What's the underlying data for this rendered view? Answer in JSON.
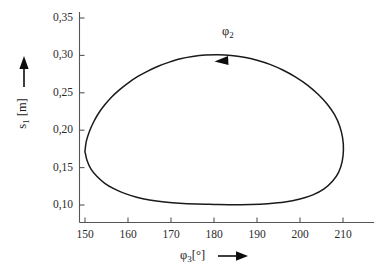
{
  "chart_data": {
    "type": "line",
    "title": "",
    "subtitle": "",
    "xlabel": "φ₃[°]",
    "ylabel": "s₁ [m]",
    "xlim": [
      144,
      216
    ],
    "ylim": [
      0.082,
      0.352
    ],
    "grid": false,
    "legend": null,
    "legend_position": "none",
    "xticks": [
      150,
      160,
      170,
      180,
      190,
      200,
      210
    ],
    "xtick_labels": [
      "150",
      "160",
      "170",
      "180",
      "190",
      "200",
      "210"
    ],
    "yticks": [
      0.1,
      0.15,
      0.2,
      0.25,
      0.3,
      0.35
    ],
    "ytick_labels": [
      "0,10",
      "0,15",
      "0,20",
      "0,25",
      "0,30",
      "0,35"
    ],
    "series": [
      {
        "name": "closed-orbit",
        "closed": true,
        "color": "#1a1a1a",
        "linewidth": 1.5,
        "points": [
          [
            150.0,
            0.172
          ],
          [
            150.3,
            0.185
          ],
          [
            151.0,
            0.198
          ],
          [
            152.0,
            0.211
          ],
          [
            153.2,
            0.223
          ],
          [
            154.6,
            0.234
          ],
          [
            156.2,
            0.2445
          ],
          [
            158.0,
            0.254
          ],
          [
            160.0,
            0.263
          ],
          [
            162.2,
            0.2715
          ],
          [
            164.6,
            0.279
          ],
          [
            167.0,
            0.2855
          ],
          [
            169.6,
            0.291
          ],
          [
            172.2,
            0.2955
          ],
          [
            175.0,
            0.2985
          ],
          [
            178.0,
            0.3005
          ],
          [
            181.0,
            0.301
          ],
          [
            184.0,
            0.3
          ],
          [
            187.0,
            0.2975
          ],
          [
            190.0,
            0.2935
          ],
          [
            193.0,
            0.288
          ],
          [
            196.0,
            0.2805
          ],
          [
            199.0,
            0.271
          ],
          [
            201.8,
            0.26
          ],
          [
            204.2,
            0.248
          ],
          [
            206.3,
            0.235
          ],
          [
            208.0,
            0.221
          ],
          [
            209.2,
            0.206
          ],
          [
            209.9,
            0.19
          ],
          [
            210.1,
            0.174
          ],
          [
            209.8,
            0.158
          ],
          [
            209.0,
            0.144
          ],
          [
            207.6,
            0.132
          ],
          [
            205.6,
            0.1215
          ],
          [
            203.0,
            0.1135
          ],
          [
            200.0,
            0.108
          ],
          [
            196.5,
            0.104
          ],
          [
            192.5,
            0.1018
          ],
          [
            188.5,
            0.1008
          ],
          [
            184.0,
            0.1005
          ],
          [
            180.0,
            0.1008
          ],
          [
            176.0,
            0.1012
          ],
          [
            172.0,
            0.1022
          ],
          [
            168.5,
            0.104
          ],
          [
            165.0,
            0.1068
          ],
          [
            162.0,
            0.1105
          ],
          [
            159.2,
            0.1155
          ],
          [
            156.8,
            0.1215
          ],
          [
            154.6,
            0.129
          ],
          [
            152.8,
            0.138
          ],
          [
            151.4,
            0.148
          ],
          [
            150.5,
            0.159
          ],
          [
            150.05,
            0.17
          ]
        ]
      }
    ],
    "annotations": [
      {
        "name": "phi2-direction-annotation",
        "text": "φ₂",
        "label_html": "φ<sub>2</sub>",
        "at_x": 181.5,
        "at_y": 0.3005,
        "arrow_direction": "left"
      }
    ]
  },
  "axes": {
    "x_label_html": "φ<sub>3</sub>[°]",
    "y_label_html": "s<sub>1</sub> [m]",
    "x_arrow_name": "x-axis-direction-arrow",
    "y_arrow_name": "y-axis-direction-arrow"
  },
  "annotation": {
    "phi2_html": "φ<sub>2</sub>"
  },
  "colors": {
    "background": "#ffffff",
    "curve": "#1a1a1a",
    "axis": "#4a4a4a",
    "text": "#1a1a1a"
  }
}
